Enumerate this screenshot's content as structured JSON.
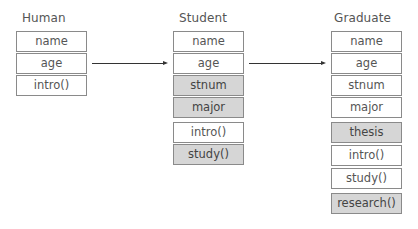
{
  "classes": [
    {
      "name": "Human",
      "members": [
        {
          "label": "name",
          "highlighted": false
        },
        {
          "label": "age",
          "highlighted": false
        },
        {
          "label": "intro()",
          "highlighted": false
        }
      ]
    },
    {
      "name": "Student",
      "members": [
        {
          "label": "name",
          "highlighted": false
        },
        {
          "label": "age",
          "highlighted": false
        },
        {
          "label": "stnum",
          "highlighted": true
        },
        {
          "label": "major",
          "highlighted": true
        },
        {
          "label": "intro()",
          "highlighted": false
        },
        {
          "label": "study()",
          "highlighted": true
        }
      ]
    },
    {
      "name": "Graduate",
      "members": [
        {
          "label": "name",
          "highlighted": false
        },
        {
          "label": "age",
          "highlighted": false
        },
        {
          "label": "stnum",
          "highlighted": false
        },
        {
          "label": "major",
          "highlighted": false
        },
        {
          "label": "thesis",
          "highlighted": true
        },
        {
          "label": "intro()",
          "highlighted": false
        },
        {
          "label": "study()",
          "highlighted": false
        },
        {
          "label": "research()",
          "highlighted": true
        }
      ]
    }
  ],
  "arrows": [
    {
      "from": "Human",
      "to": "Student"
    },
    {
      "from": "Student",
      "to": "Graduate"
    }
  ],
  "colors": {
    "highlight_fill": "#d6d6d6",
    "border": "#8a8a8a",
    "arrow": "#333333"
  }
}
